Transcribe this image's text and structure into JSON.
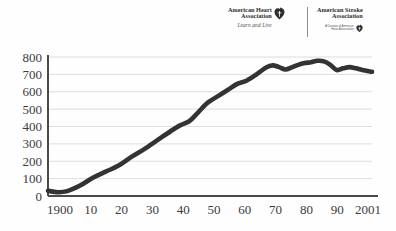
{
  "logos": {
    "heart": {
      "line1": "American Heart",
      "line2": "Association",
      "tagline": "Learn and Live",
      "mark": "heart-torch-icon"
    },
    "stroke": {
      "line1": "American Stroke",
      "line2": "Association",
      "sub1": "A Division of American",
      "sub2": "Heart Association",
      "mark": "heart-torch-icon"
    }
  },
  "chart_data": {
    "type": "line",
    "title": "",
    "subtitle": "",
    "xlabel": "",
    "ylabel": "",
    "grid": true,
    "legend": "none",
    "line_color": "#333333",
    "grid_color": "#d6d6d6",
    "axis_color": "#4a4a4a",
    "background": "#ffffff",
    "xlim": [
      1900,
      2001
    ],
    "ylim": [
      0,
      800
    ],
    "y_ticks": [
      0,
      100,
      200,
      300,
      400,
      500,
      600,
      700,
      800
    ],
    "y_tick_labels": [
      "0",
      "100",
      "200",
      "300",
      "400",
      "500",
      "600",
      "700",
      "800"
    ],
    "x_ticks": [
      1900,
      1910,
      1920,
      1930,
      1940,
      1950,
      1960,
      1970,
      1980,
      1990,
      2001
    ],
    "x_tick_labels": [
      "1900",
      "10",
      "20",
      "30",
      "40",
      "50",
      "60",
      "70",
      "80",
      "90",
      "2001"
    ],
    "series": [
      {
        "name": "value",
        "x": [
          1900,
          1903,
          1906,
          1910,
          1914,
          1918,
          1922,
          1926,
          1930,
          1934,
          1938,
          1941,
          1944,
          1946,
          1948,
          1950,
          1953,
          1956,
          1959,
          1962,
          1965,
          1968,
          1970,
          1972,
          1974,
          1976,
          1978,
          1980,
          1982,
          1984,
          1986,
          1988,
          1990,
          1992,
          1994,
          1996,
          1998,
          2001
        ],
        "values": [
          30,
          22,
          28,
          60,
          105,
          140,
          175,
          225,
          270,
          320,
          370,
          405,
          430,
          465,
          505,
          540,
          575,
          610,
          645,
          665,
          700,
          740,
          752,
          742,
          728,
          740,
          755,
          765,
          770,
          778,
          775,
          755,
          725,
          735,
          742,
          735,
          725,
          715
        ]
      }
    ]
  }
}
